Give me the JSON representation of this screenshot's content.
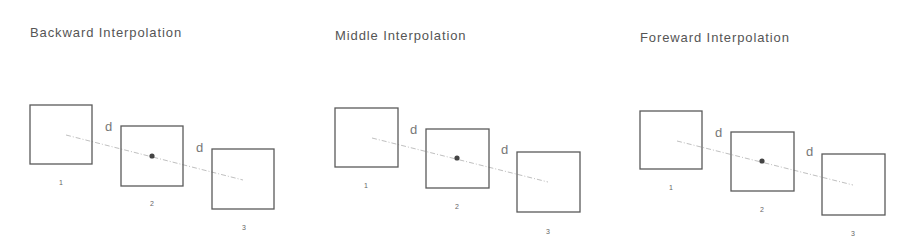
{
  "panels": [
    {
      "title": "Backward Interpolation",
      "title_pos": [
        30,
        37
      ],
      "frames": [
        {
          "label": "1",
          "x": 30,
          "y": 105,
          "w": 62,
          "h": 59,
          "label_pos": [
            59,
            185
          ]
        },
        {
          "label": "2",
          "x": 121,
          "y": 126,
          "w": 62,
          "h": 60,
          "label_pos": [
            150,
            206
          ]
        },
        {
          "label": "3",
          "x": 212,
          "y": 149,
          "w": 62,
          "h": 60,
          "label_pos": [
            242,
            230
          ]
        }
      ],
      "distance_labels": [
        {
          "text": "d",
          "pos": [
            105,
            131
          ]
        },
        {
          "text": "d",
          "pos": [
            196,
            152
          ]
        }
      ],
      "track": {
        "from": [
          66,
          135
        ],
        "to": [
          243,
          180
        ]
      },
      "dot": [
        152,
        156
      ]
    },
    {
      "title": "Middle Interpolation",
      "title_pos": [
        335,
        40
      ],
      "frames": [
        {
          "label": "1",
          "x": 335,
          "y": 108,
          "w": 63,
          "h": 59,
          "label_pos": [
            364,
            188
          ]
        },
        {
          "label": "2",
          "x": 426,
          "y": 129,
          "w": 63,
          "h": 59,
          "label_pos": [
            455,
            209
          ]
        },
        {
          "label": "3",
          "x": 517,
          "y": 152,
          "w": 63,
          "h": 60,
          "label_pos": [
            546,
            234
          ]
        }
      ],
      "distance_labels": [
        {
          "text": "d",
          "pos": [
            410,
            134
          ]
        },
        {
          "text": "d",
          "pos": [
            501,
            154
          ]
        }
      ],
      "track": {
        "from": [
          372,
          138
        ],
        "to": [
          548,
          182
        ]
      },
      "dot": [
        457,
        158
      ]
    },
    {
      "title": "Foreward Interpolation",
      "title_pos": [
        640,
        42
      ],
      "frames": [
        {
          "label": "1",
          "x": 640,
          "y": 111,
          "w": 62,
          "h": 58,
          "label_pos": [
            669,
            190
          ]
        },
        {
          "label": "2",
          "x": 731,
          "y": 132,
          "w": 63,
          "h": 59,
          "label_pos": [
            760,
            212
          ]
        },
        {
          "label": "3",
          "x": 822,
          "y": 154,
          "w": 63,
          "h": 61,
          "label_pos": [
            851,
            236
          ]
        }
      ],
      "distance_labels": [
        {
          "text": "d",
          "pos": [
            715,
            137
          ]
        },
        {
          "text": "d",
          "pos": [
            806,
            156
          ]
        }
      ],
      "track": {
        "from": [
          677,
          141
        ],
        "to": [
          853,
          185
        ]
      },
      "dot": [
        762,
        161
      ]
    }
  ],
  "colors": {
    "background": "#ffffff",
    "frame_stroke": "#5a5a5a",
    "track": "#b8b8b8",
    "dot": "#444444",
    "title_text": "#555555"
  }
}
